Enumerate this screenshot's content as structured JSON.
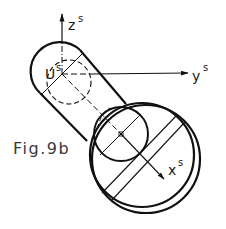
{
  "figure": {
    "caption": "Fig.9b",
    "stroke_color": "#111111",
    "background": "#ffffff"
  },
  "axes": {
    "z": {
      "label": "z",
      "superscript": "s"
    },
    "y": {
      "label": "y",
      "superscript": "s"
    },
    "x": {
      "label": "x",
      "superscript": "s"
    }
  },
  "point": {
    "label": "U",
    "superscript": "s"
  }
}
